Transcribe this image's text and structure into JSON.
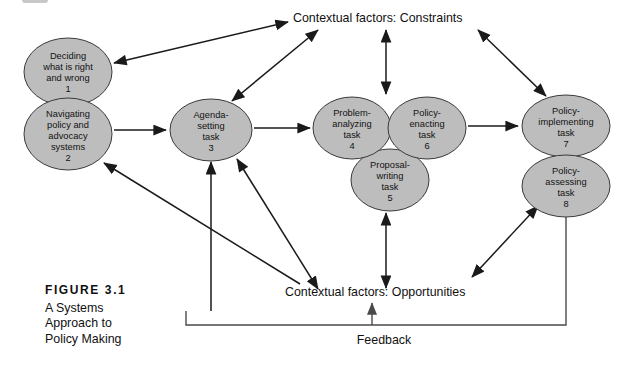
{
  "figure": {
    "number_label": "FIGURE  3.1",
    "title_lines": [
      "A Systems",
      "Approach to",
      "Policy Making"
    ]
  },
  "diagram": {
    "type": "systems-flow-diagram",
    "colors": {
      "node_fill": "#bdbdbd",
      "node_stroke": "#3a3a3a",
      "edge": "#1a1a1a",
      "text": "#111111",
      "background": "#ffffff"
    },
    "contextual_factors": {
      "constraints_label": "Contextual factors: Constraints",
      "opportunities_label": "Contextual factors: Opportunities"
    },
    "feedback_label": "Feedback",
    "nodes": [
      {
        "id": 1,
        "number": "1",
        "lines": [
          "Deciding",
          "what is right",
          "and wrong"
        ],
        "cx": 68,
        "cy": 72,
        "rx": 44,
        "ry": 34
      },
      {
        "id": 2,
        "number": "2",
        "lines": [
          "Navigating",
          "policy and",
          "advocacy",
          "systems"
        ],
        "cx": 68,
        "cy": 134,
        "rx": 44,
        "ry": 36
      },
      {
        "id": 3,
        "number": "3",
        "lines": [
          "Agenda-",
          "setting",
          "task"
        ],
        "cx": 211,
        "cy": 130,
        "rx": 41,
        "ry": 31
      },
      {
        "id": 4,
        "number": "4",
        "lines": [
          "Problem-",
          "analyzing",
          "task"
        ],
        "cx": 352,
        "cy": 128,
        "rx": 39,
        "ry": 31
      },
      {
        "id": 5,
        "number": "5",
        "lines": [
          "Proposal-",
          "writing",
          "task"
        ],
        "cx": 390,
        "cy": 180,
        "rx": 39,
        "ry": 31
      },
      {
        "id": 6,
        "number": "6",
        "lines": [
          "Policy-",
          "enacting",
          "task"
        ],
        "cx": 427,
        "cy": 128,
        "rx": 39,
        "ry": 31
      },
      {
        "id": 7,
        "number": "7",
        "lines": [
          "Policy-",
          "implementing",
          "task"
        ],
        "cx": 566,
        "cy": 126,
        "rx": 44,
        "ry": 31
      },
      {
        "id": 8,
        "number": "8",
        "lines": [
          "Policy-",
          "assessing",
          "task"
        ],
        "cx": 566,
        "cy": 186,
        "rx": 44,
        "ry": 31
      }
    ],
    "edges": [
      {
        "name": "node1-constraints",
        "from": "node-1",
        "to": "constraints",
        "style": "double-arrow"
      },
      {
        "name": "node3-constraints",
        "from": "node-3",
        "to": "constraints",
        "style": "double-arrow"
      },
      {
        "name": "node4-constraints",
        "from": "node-4-6",
        "to": "constraints",
        "style": "double-arrow"
      },
      {
        "name": "node7-constraints",
        "from": "node-7",
        "to": "constraints",
        "style": "double-arrow"
      },
      {
        "name": "node2-node3",
        "from": "node-2",
        "to": "node-3",
        "style": "arrow"
      },
      {
        "name": "node3-node4",
        "from": "node-3",
        "to": "node-4",
        "style": "arrow"
      },
      {
        "name": "node6-node7",
        "from": "node-6",
        "to": "node-7",
        "style": "arrow"
      },
      {
        "name": "node5-opportunities",
        "from": "node-5",
        "to": "opportunities",
        "style": "double-arrow"
      },
      {
        "name": "node3-opportunities",
        "from": "node-3",
        "to": "opportunities",
        "style": "double-arrow"
      },
      {
        "name": "node8-opportunities",
        "from": "node-8",
        "to": "opportunities",
        "style": "double-arrow"
      },
      {
        "name": "opportunities-node2",
        "from": "opportunities",
        "to": "node-2",
        "style": "arrow"
      },
      {
        "name": "feedback-loop",
        "from": "node-8",
        "to": "opportunities",
        "style": "line-with-arrow"
      }
    ]
  }
}
